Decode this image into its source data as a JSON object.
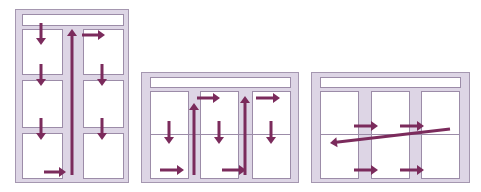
{
  "colors": {
    "frame_fill": "#ddd5e5",
    "frame_stroke": "#a597b0",
    "cell_stroke": "#9c8ca8",
    "arrow": "#7b2b5c",
    "background": "#ffffff"
  },
  "panels": [
    {
      "name": "layout-two-column-portrait",
      "description": "Two-column tall layout; reading path goes down column 1, then up the gutter to column 2 and down again",
      "frame": {
        "x": 15,
        "y": 9,
        "w": 113,
        "h": 173
      },
      "header": {
        "x": 22,
        "y": 14,
        "w": 101,
        "h": 11
      },
      "cells": [
        {
          "x": 22,
          "y": 29,
          "w": 40,
          "h": 45
        },
        {
          "x": 22,
          "y": 80,
          "w": 40,
          "h": 47
        },
        {
          "x": 22,
          "y": 133,
          "w": 40,
          "h": 45
        },
        {
          "x": 83,
          "y": 29,
          "w": 40,
          "h": 45
        },
        {
          "x": 83,
          "y": 80,
          "w": 40,
          "h": 47
        },
        {
          "x": 83,
          "y": 133,
          "w": 40,
          "h": 45
        }
      ],
      "dividers": [],
      "arrows": [
        {
          "x1": 41,
          "y1": 23,
          "x2": 41,
          "y2": 45,
          "dir": "down"
        },
        {
          "x1": 41,
          "y1": 64,
          "x2": 41,
          "y2": 86,
          "dir": "down"
        },
        {
          "x1": 41,
          "y1": 118,
          "x2": 41,
          "y2": 140,
          "dir": "down"
        },
        {
          "x1": 44,
          "y1": 172,
          "x2": 66,
          "y2": 172,
          "dir": "right"
        },
        {
          "x1": 72,
          "y1": 175,
          "x2": 72,
          "y2": 29,
          "dir": "up"
        },
        {
          "x1": 82,
          "y1": 35,
          "x2": 105,
          "y2": 35,
          "dir": "right"
        },
        {
          "x1": 102,
          "y1": 64,
          "x2": 102,
          "y2": 86,
          "dir": "down"
        },
        {
          "x1": 102,
          "y1": 118,
          "x2": 102,
          "y2": 140,
          "dir": "down"
        }
      ]
    },
    {
      "name": "layout-three-column-landscape-columnwise",
      "description": "Three-column landscape layout; reading path goes down each column, then up the gutter to the next column",
      "frame": {
        "x": 141,
        "y": 72,
        "w": 157,
        "h": 110
      },
      "header": {
        "x": 150,
        "y": 77,
        "w": 140,
        "h": 10
      },
      "cells": [
        {
          "x": 150,
          "y": 91,
          "w": 38,
          "h": 87
        },
        {
          "x": 200,
          "y": 91,
          "w": 38,
          "h": 87
        },
        {
          "x": 252,
          "y": 91,
          "w": 38,
          "h": 87
        }
      ],
      "dividers": [
        {
          "x1": 150,
          "y1": 134,
          "x2": 290,
          "y2": 134
        }
      ],
      "arrows": [
        {
          "x1": 169,
          "y1": 121,
          "x2": 169,
          "y2": 144,
          "dir": "down"
        },
        {
          "x1": 160,
          "y1": 170,
          "x2": 184,
          "y2": 170,
          "dir": "right"
        },
        {
          "x1": 194,
          "y1": 175,
          "x2": 194,
          "y2": 103,
          "dir": "up"
        },
        {
          "x1": 197,
          "y1": 98,
          "x2": 220,
          "y2": 98,
          "dir": "right"
        },
        {
          "x1": 219,
          "y1": 121,
          "x2": 219,
          "y2": 144,
          "dir": "down"
        },
        {
          "x1": 222,
          "y1": 170,
          "x2": 246,
          "y2": 170,
          "dir": "right"
        },
        {
          "x1": 245,
          "y1": 175,
          "x2": 245,
          "y2": 96,
          "dir": "up"
        },
        {
          "x1": 256,
          "y1": 98,
          "x2": 280,
          "y2": 98,
          "dir": "right"
        },
        {
          "x1": 271,
          "y1": 121,
          "x2": 271,
          "y2": 144,
          "dir": "down"
        }
      ]
    },
    {
      "name": "layout-three-column-landscape-rowwise",
      "description": "Three-column landscape layout; reading path goes across rows through the gutters, returning diagonally to the start of the next row",
      "frame": {
        "x": 311,
        "y": 72,
        "w": 158,
        "h": 110
      },
      "header": {
        "x": 320,
        "y": 77,
        "w": 140,
        "h": 10
      },
      "cells": [
        {
          "x": 320,
          "y": 91,
          "w": 38,
          "h": 87
        },
        {
          "x": 371,
          "y": 91,
          "w": 38,
          "h": 87
        },
        {
          "x": 421,
          "y": 91,
          "w": 38,
          "h": 87
        }
      ],
      "dividers": [
        {
          "x1": 320,
          "y1": 134,
          "x2": 459,
          "y2": 134
        }
      ],
      "arrows": [
        {
          "x1": 354,
          "y1": 126,
          "x2": 378,
          "y2": 126,
          "dir": "right"
        },
        {
          "x1": 400,
          "y1": 126,
          "x2": 424,
          "y2": 126,
          "dir": "right"
        },
        {
          "x1": 450,
          "y1": 129,
          "x2": 330,
          "y2": 143,
          "dir": "left-diagonal"
        },
        {
          "x1": 354,
          "y1": 170,
          "x2": 378,
          "y2": 170,
          "dir": "right"
        },
        {
          "x1": 400,
          "y1": 170,
          "x2": 424,
          "y2": 170,
          "dir": "right"
        }
      ]
    }
  ]
}
